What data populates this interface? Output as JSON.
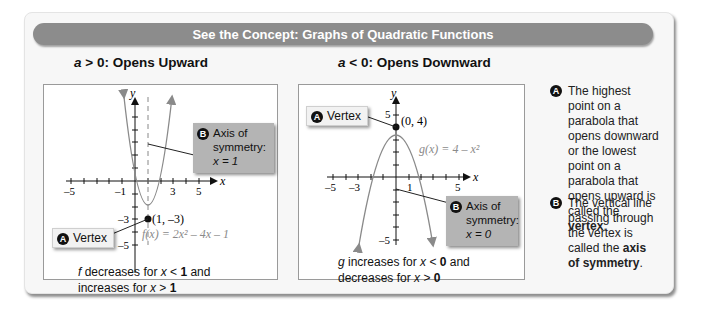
{
  "banner": {
    "title": "See the Concept: Graphs of Quadratic Functions"
  },
  "left": {
    "heading_var": "a",
    "heading_rest": " > 0: Opens Upward",
    "y_label": "y",
    "x_label": "x",
    "x_ticks": [
      "–5",
      "–1",
      "3",
      "5"
    ],
    "y_ticks": [
      "–3",
      "–5"
    ],
    "vertex_point": "(1, –3)",
    "equation": "f(x) = 2x² – 4x – 1",
    "callout_vertex": {
      "badge": "A",
      "text": "Vertex"
    },
    "callout_axis": {
      "badge": "B",
      "line1": "Axis of",
      "line2": "symmetry:",
      "line3": "x = 1"
    },
    "caption_var": "f",
    "caption_1": " decreases for ",
    "caption_x": "x",
    "caption_2": " < ",
    "caption_v1": "1",
    "caption_3": " and",
    "caption_line2a": "increases for ",
    "caption_line2b": " > ",
    "caption_v2": "1"
  },
  "right": {
    "heading_var": "a",
    "heading_rest": " < 0: Opens Downward",
    "y_label": "y",
    "x_label": "x",
    "x_ticks": [
      "–5",
      "–3",
      "1",
      "5"
    ],
    "y_ticks": [
      "5",
      "–5"
    ],
    "vertex_point": "(0, 4)",
    "equation": "g(x) = 4 – x²",
    "callout_vertex": {
      "badge": "A",
      "text": "Vertex"
    },
    "callout_axis": {
      "badge": "B",
      "line1": "Axis of",
      "line2": "symmetry:",
      "line3": "x = 0"
    },
    "caption_var": "g",
    "caption_1": " increases for ",
    "caption_x": "x",
    "caption_2": " < ",
    "caption_v1": "0",
    "caption_3": " and",
    "caption_line2a": "decreases for ",
    "caption_line2b": " > ",
    "caption_v2": "0"
  },
  "notes": [
    {
      "badge": "A",
      "text_before": "The highest point on a parabola that opens downward or the lowest point on a parabola that opens upward is called the ",
      "bold": "vertex",
      "text_after": "."
    },
    {
      "badge": "B",
      "text_before": "The vertical line passing through the vertex is called the ",
      "bold": "axis of symmetry",
      "text_after": "."
    }
  ],
  "colors": {
    "banner": "#8c8c8c",
    "callout": "#b4b4b4",
    "curve": "#8a8a8a",
    "card": "#f7f7f7"
  }
}
